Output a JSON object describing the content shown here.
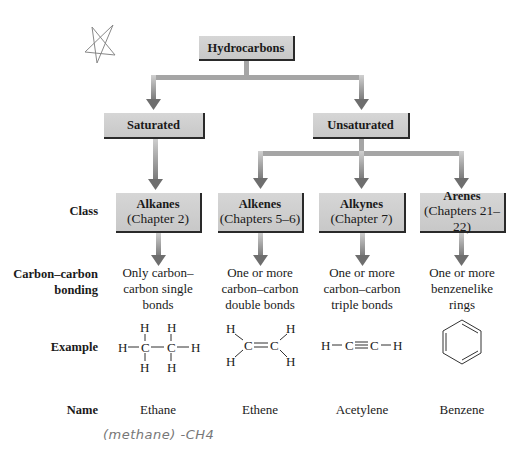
{
  "diagram": {
    "root": {
      "label": "Hydrocarbons"
    },
    "branches": [
      {
        "label": "Saturated"
      },
      {
        "label": "Unsaturated"
      }
    ],
    "row_labels": {
      "class": "Class",
      "bonding_line1": "Carbon–carbon",
      "bonding_line2": "bonding",
      "example": "Example",
      "name": "Name"
    },
    "classes": [
      {
        "title": "Alkanes",
        "chapter": "(Chapter 2)",
        "bonding": [
          "Only carbon–",
          "carbon single",
          "bonds"
        ],
        "name": "Ethane"
      },
      {
        "title": "Alkenes",
        "chapter": "(Chapters 5–6)",
        "bonding": [
          "One or more",
          "carbon–carbon",
          "double bonds"
        ],
        "name": "Ethene"
      },
      {
        "title": "Alkynes",
        "chapter": "(Chapter 7)",
        "bonding": [
          "One or more",
          "carbon–carbon",
          "triple bonds"
        ],
        "name": "Acetylene"
      },
      {
        "title": "Arenes",
        "chapter": "(Chapters 21–22)",
        "bonding": [
          "One or more",
          "benzenelike",
          "rings"
        ],
        "name": "Benzene"
      }
    ],
    "structures": {
      "ethane": {
        "H": "H",
        "C": "C"
      },
      "ethene": {
        "H": "H",
        "C": "C"
      },
      "acetylene": {
        "H": "H",
        "C": "C"
      }
    },
    "colors": {
      "box_fill": "#cfcfcf",
      "box_shadow": "#2a2a2a",
      "arrow": "#8a8a8a",
      "arrow_head": "#6e6e6e"
    }
  },
  "annotations": {
    "handwritten_note": "(methane) -CH4",
    "star_doodle": "star-doodle"
  }
}
